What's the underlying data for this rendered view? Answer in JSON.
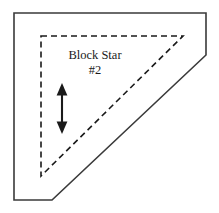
{
  "diagram": {
    "title": "Block Star",
    "number": "#2",
    "type": "quilt-block-piece-template",
    "colors": {
      "outline": "#3a3a3a",
      "dashed_seam": "#1a1a1a",
      "arrow": "#1a1a1a",
      "text": "#1a1a1a",
      "background": "#ffffff"
    },
    "outline_shape": {
      "name": "cut-piece-outline",
      "stroke_style": "solid",
      "stroke_width": 1.6,
      "points": "14,13 206,13 206,55 52,200 14,200"
    },
    "dashed_shape": {
      "name": "seam-allowance-triangle",
      "stroke_style": "dashed",
      "stroke_width": 1.6,
      "dash_pattern": "6,4",
      "points": "41,36 183,36 41,176"
    },
    "arrow": {
      "name": "grain-line-arrow",
      "orientation": "vertical",
      "heads": "double",
      "x": 62,
      "y_top": 84,
      "y_bottom": 133
    },
    "title_position": {
      "x": 95,
      "y": 59
    },
    "number_position": {
      "x": 95,
      "y": 74
    }
  }
}
